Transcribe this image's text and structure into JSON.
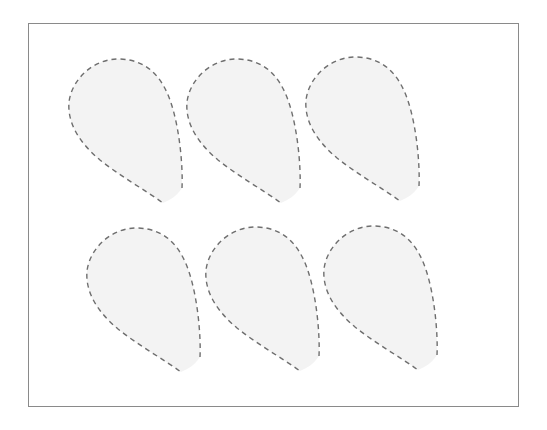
{
  "diagram": {
    "frame": {
      "x": 28,
      "y": 23,
      "width": 491,
      "height": 384,
      "stroke_color": "#8a8a8a"
    },
    "shape_style": {
      "fill_color": "#f3f3f3",
      "stroke_color": "#6e6e6e",
      "stroke_style": "dashed"
    },
    "shapes": [
      {
        "id": "petal-1",
        "row": 1,
        "col": 1,
        "dx": 0,
        "dy": 0
      },
      {
        "id": "petal-2",
        "row": 1,
        "col": 2,
        "dx": 118,
        "dy": 0
      },
      {
        "id": "petal-3",
        "row": 1,
        "col": 3,
        "dx": 237,
        "dy": -2
      },
      {
        "id": "petal-4",
        "row": 2,
        "col": 1,
        "dx": 18,
        "dy": 169
      },
      {
        "id": "petal-5",
        "row": 2,
        "col": 2,
        "dx": 137,
        "dy": 168
      },
      {
        "id": "petal-6",
        "row": 2,
        "col": 3,
        "dx": 255,
        "dy": 167
      }
    ]
  }
}
